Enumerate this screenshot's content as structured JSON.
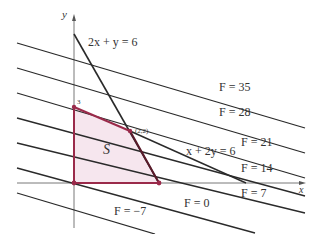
{
  "diagram": {
    "axes": {
      "x_label": "x",
      "y_label": "y"
    },
    "constraints": [
      {
        "label": "2x + y = 6"
      },
      {
        "label": "x + 2y = 6"
      }
    ],
    "region": {
      "label": "S",
      "fill": "#f6e6ee",
      "edge_color": "#9a2a4a"
    },
    "vertices": [
      {
        "label": "3"
      },
      {
        "label": "(2,2)"
      }
    ],
    "level_lines": [
      {
        "label": "F = 35"
      },
      {
        "label": "F = 28"
      },
      {
        "label": "F = 21"
      },
      {
        "label": "F = 14"
      },
      {
        "label": "F = 7"
      },
      {
        "label": "F = 0"
      },
      {
        "label": "F = −7"
      }
    ],
    "colors": {
      "line": "#2a2a2a",
      "region_edge": "#9a2a4a",
      "region_fill": "#f6e6ee",
      "axis": "#555555"
    }
  }
}
